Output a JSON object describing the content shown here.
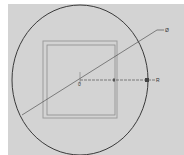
{
  "drawing": {
    "background": "#d3d3d3",
    "circle": {
      "cx": 80,
      "cy": 80,
      "rx": 68,
      "ry": 75,
      "stroke": "#3a3a3a"
    },
    "outer_square": {
      "x": 43,
      "y": 41,
      "w": 74,
      "h": 77,
      "stroke": "#9a9a9a"
    },
    "inner_square": {
      "x": 47,
      "y": 45,
      "w": 68,
      "h": 70,
      "stroke": "#8a8a8a"
    },
    "diameter_dimension": {
      "label": "Ø",
      "x1": 22,
      "y1": 115,
      "x2": 157,
      "y2": 30
    },
    "radius_dimension": {
      "label": "R",
      "x1": 80,
      "y1": 80,
      "x2": 148,
      "y2": 80
    },
    "center_label": "0",
    "mid_label": "0"
  }
}
